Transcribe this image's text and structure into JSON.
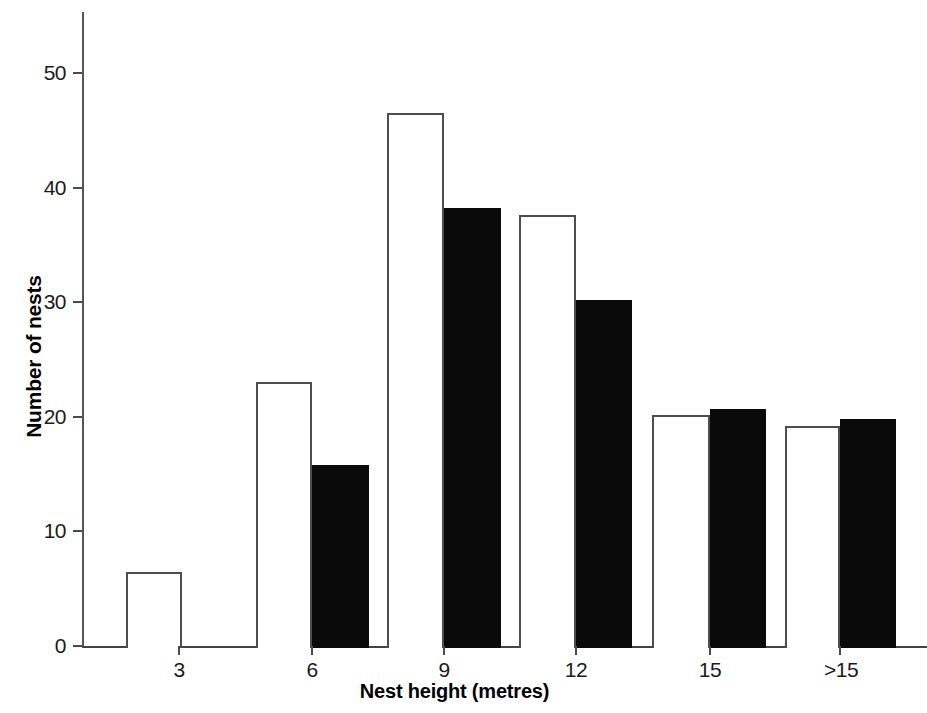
{
  "chart_data": {
    "type": "bar",
    "title": "",
    "xlabel": "Nest height (metres)",
    "ylabel": "Number of nests",
    "categories": [
      "3",
      "6",
      "9",
      "12",
      "15",
      ">15"
    ],
    "series": [
      {
        "name": "white",
        "fill": "#ffffff",
        "values": [
          6.5,
          23.0,
          46.5,
          37.6,
          20.2,
          19.2
        ]
      },
      {
        "name": "black",
        "fill": "#000000",
        "values": [
          0,
          15.8,
          38.2,
          30.2,
          20.7,
          19.8
        ]
      }
    ],
    "yticks": [
      0,
      10,
      20,
      30,
      40,
      50
    ],
    "ytick_labels": [
      "0",
      "10",
      "20",
      "30",
      "40",
      "50"
    ],
    "ylim": [
      0,
      55
    ],
    "grid": false,
    "legend": "none"
  },
  "axis": {
    "y_title": "Number of nests",
    "x_title": "Nest height (metres)"
  }
}
